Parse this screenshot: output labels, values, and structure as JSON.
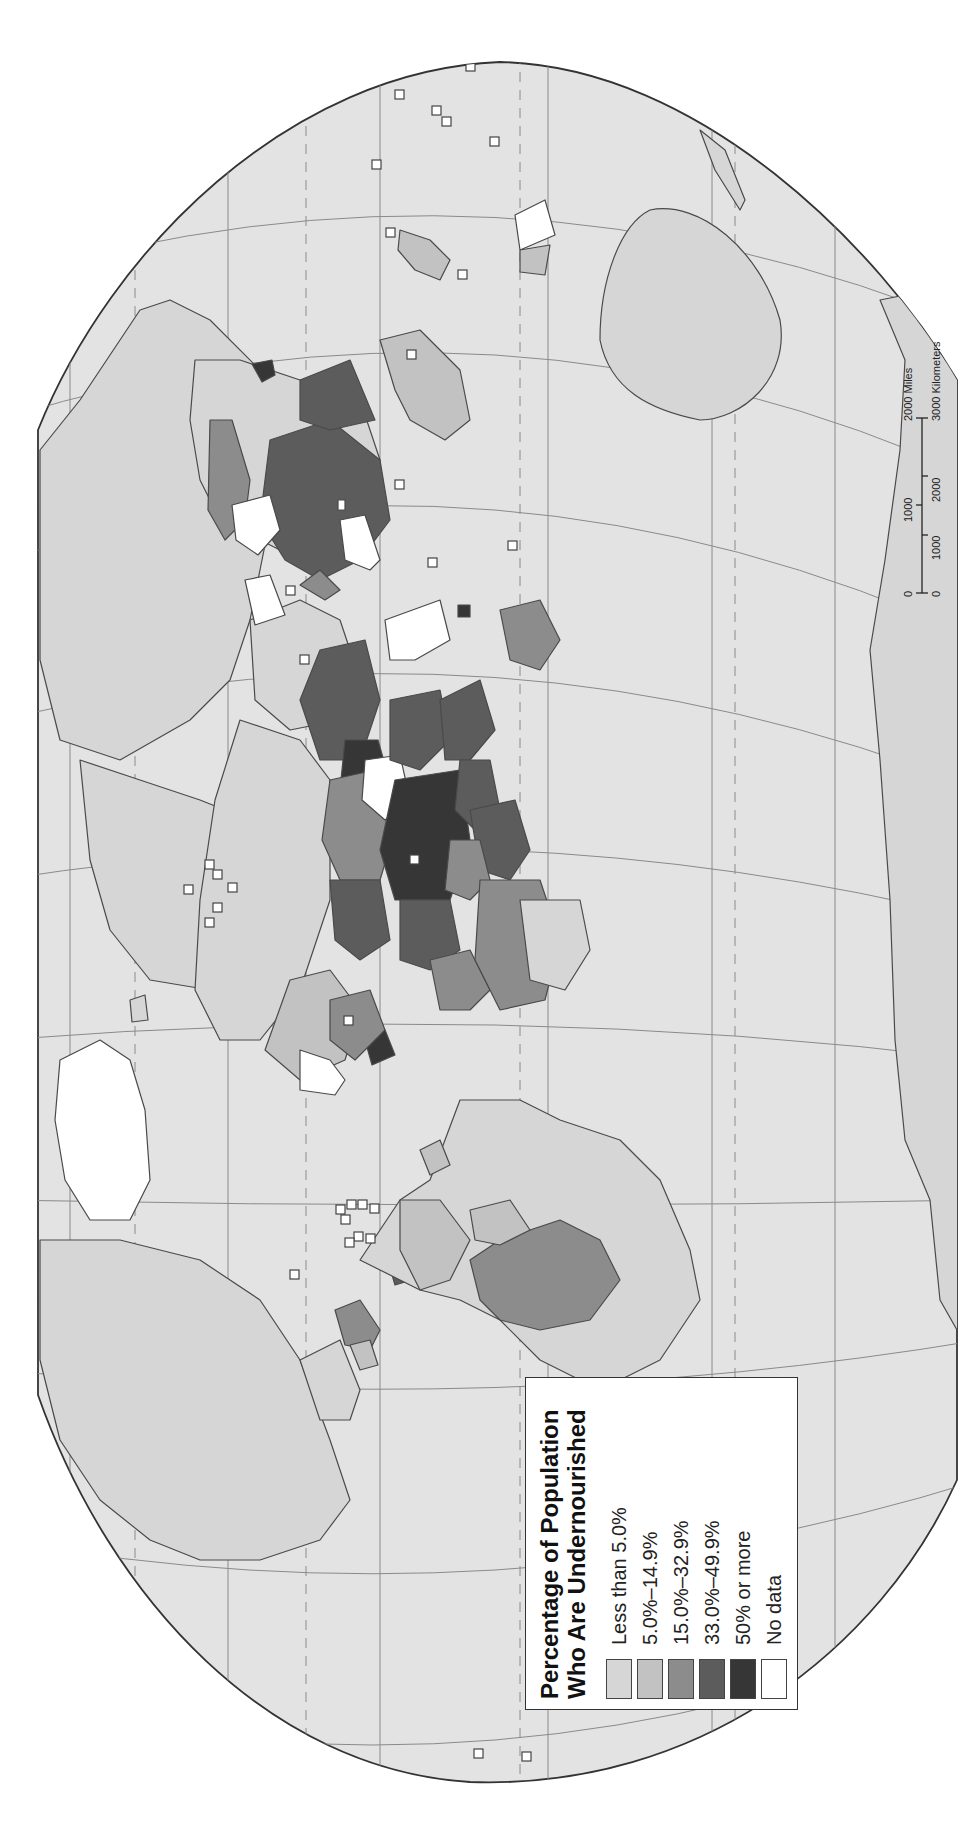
{
  "map": {
    "projection_note": "World map, rotated 90 degrees counter-clockwise",
    "colors": {
      "ocean": "#e3e3e3",
      "border": "#4a4a4a",
      "graticule": "#8a8a8a",
      "class_1": "#d6d6d6",
      "class_2": "#c2c2c2",
      "class_3": "#8c8c8c",
      "class_4": "#5c5c5c",
      "class_5": "#363636",
      "no_data": "#ffffff"
    }
  },
  "legend": {
    "title_line1": "Percentage of Population",
    "title_line2": "Who Are Undernourished",
    "items": [
      {
        "label": "Less than 5.0%",
        "color": "#d6d6d6"
      },
      {
        "label": "5.0%–14.9%",
        "color": "#c2c2c2"
      },
      {
        "label": "15.0%–32.9%",
        "color": "#8c8c8c"
      },
      {
        "label": "33.0%–49.9%",
        "color": "#5c5c5c"
      },
      {
        "label": "50% or more",
        "color": "#363636"
      },
      {
        "label": "No data",
        "color": "#ffffff"
      }
    ]
  },
  "scale_bar": {
    "miles": {
      "ticks": [
        "0",
        "1000",
        "2000"
      ],
      "unit": "Miles",
      "unit_label": "2000 Miles"
    },
    "kilometers": {
      "ticks": [
        "0",
        "1000",
        "2000",
        "3000"
      ],
      "unit": "Kilometers",
      "unit_label": "3000 Kilometers"
    }
  }
}
